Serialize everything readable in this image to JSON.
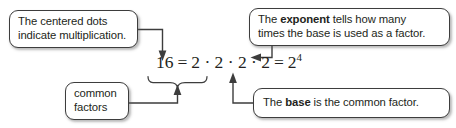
{
  "diagram": {
    "title_text": "Exponent notation annotated diagram",
    "equation": {
      "left_value": "16",
      "equals_1": "=",
      "factors": "2 · 2 · 2 · 2",
      "equals_2": "=",
      "base": "2",
      "exponent": "4"
    },
    "callouts": {
      "dots": {
        "line1": "The centered dots",
        "line2": "indicate multiplication."
      },
      "exponent": {
        "line1_a": "The ",
        "line1_b": "exponent",
        "line1_c": " tells how many",
        "line2": "times the base is used as a factor."
      },
      "common": {
        "line1": "common",
        "line2": "factors"
      },
      "base": {
        "line_a": "The ",
        "line_b": "base",
        "line_c": " is the common factor."
      }
    },
    "colors": {
      "border": "#3d3d3d",
      "text": "#231f20",
      "connector": "#3d3d3d",
      "background": "#ffffff"
    }
  }
}
